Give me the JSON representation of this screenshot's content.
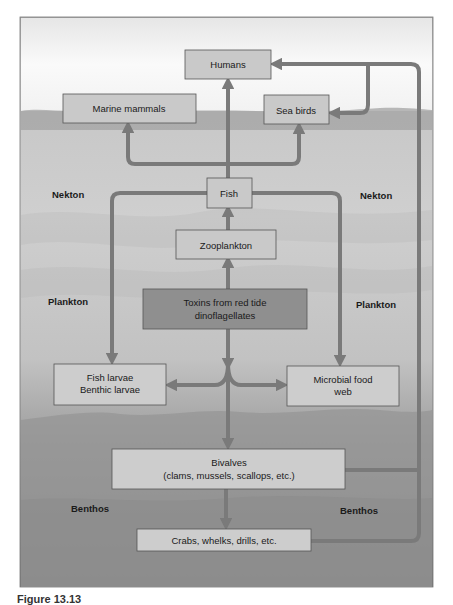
{
  "diagram": {
    "colors": {
      "box_fill": "#c9c9c9",
      "toxin_box_fill": "#8f8f8f",
      "box_stroke": "#555555",
      "arrow": "#7a7a7a",
      "sky_top": "#f4f4f4",
      "water_mid": "#b7b7b7",
      "water_deep": "#8a8a8a"
    },
    "nodes": {
      "humans": "Humans",
      "marine_mammals": "Marine mammals",
      "sea_birds": "Sea birds",
      "fish": "Fish",
      "zooplankton": "Zooplankton",
      "toxins_line1": "Toxins from red tide",
      "toxins_line2": "dinoflagellates",
      "larvae_line1": "Fish larvae",
      "larvae_line2": "Benthic larvae",
      "microbial_line1": "Microbial food",
      "microbial_line2": "web",
      "bivalves_line1": "Bivalves",
      "bivalves_line2": "(clams, mussels, scallops, etc.)",
      "crabs": "Crabs, whelks, drills, etc."
    },
    "zones": {
      "nekton_left": "Nekton",
      "nekton_right": "Nekton",
      "plankton_left": "Plankton",
      "plankton_right": "Plankton",
      "benthos_left": "Benthos",
      "benthos_right": "Benthos"
    },
    "edges": [
      {
        "from": "Toxins from red tide dinoflagellates",
        "to": "Zooplankton"
      },
      {
        "from": "Zooplankton",
        "to": "Fish"
      },
      {
        "from": "Fish",
        "to": "Humans"
      },
      {
        "from": "Fish",
        "to": "Marine mammals"
      },
      {
        "from": "Fish",
        "to": "Sea birds"
      },
      {
        "from": "Fish",
        "to": "Fish larvae / Benthic larvae"
      },
      {
        "from": "Fish",
        "to": "Microbial food web"
      },
      {
        "from": "Toxins from red tide dinoflagellates",
        "to": "Fish larvae / Benthic larvae"
      },
      {
        "from": "Toxins from red tide dinoflagellates",
        "to": "Microbial food web"
      },
      {
        "from": "Toxins from red tide dinoflagellates",
        "to": "Bivalves"
      },
      {
        "from": "Bivalves",
        "to": "Crabs, whelks, drills, etc."
      },
      {
        "from": "Bivalves",
        "to": "Humans"
      },
      {
        "from": "Bivalves",
        "to": "Sea birds"
      },
      {
        "from": "Crabs, whelks, drills, etc.",
        "to": "Humans"
      }
    ]
  },
  "caption": "Figure 13.13"
}
